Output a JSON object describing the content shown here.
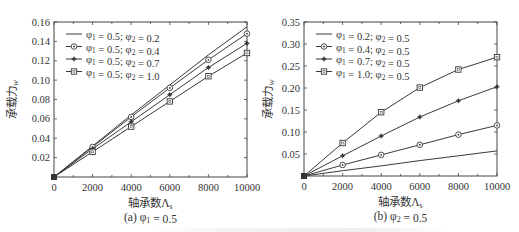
{
  "chart_data": [
    {
      "type": "line",
      "panel_label": "(a) φ1 = 0.5",
      "xlabel": "轴承数Λs",
      "ylabel": "承载力w",
      "xlim": [
        0,
        10000
      ],
      "ylim": [
        0,
        0.16
      ],
      "xticks": [
        0,
        2000,
        4000,
        6000,
        8000,
        10000
      ],
      "yticks": [
        0.02,
        0.04,
        0.06,
        0.08,
        0.1,
        0.12,
        0.14,
        0.16
      ],
      "ytick_labels": [
        "0.02",
        "0.04",
        "0.06",
        "0.08",
        "0.10",
        "0.12",
        "0.14",
        "0.16"
      ],
      "x": [
        0,
        2000,
        4000,
        6000,
        8000,
        10000
      ],
      "legend_position": "upper left",
      "grid": false,
      "series": [
        {
          "name": "φ1 = 0.5; φ2 = 0.2",
          "marker": "none",
          "values": [
            0,
            0.032,
            0.064,
            0.095,
            0.126,
            0.155
          ]
        },
        {
          "name": "φ1 = 0.5; φ2 = 0.4",
          "marker": "circle",
          "values": [
            0,
            0.031,
            0.062,
            0.092,
            0.121,
            0.148
          ]
        },
        {
          "name": "φ1 = 0.5; φ2 = 0.7",
          "marker": "star",
          "values": [
            0,
            0.029,
            0.057,
            0.085,
            0.113,
            0.138
          ]
        },
        {
          "name": "φ1 = 0.5; φ2 = 1.0",
          "marker": "square",
          "values": [
            0,
            0.026,
            0.052,
            0.078,
            0.104,
            0.128
          ]
        }
      ]
    },
    {
      "type": "line",
      "panel_label": "(b) φ2 = 0.5",
      "xlabel": "轴承数Λs",
      "ylabel": "承载力w",
      "xlim": [
        0,
        10000
      ],
      "ylim": [
        0,
        0.35
      ],
      "xticks": [
        0,
        2000,
        4000,
        6000,
        8000,
        10000
      ],
      "yticks": [
        0.05,
        0.1,
        0.15,
        0.2,
        0.25,
        0.3,
        0.35
      ],
      "ytick_labels": [
        "0.05",
        "0.10",
        "0.15",
        "0.20",
        "0.25",
        "0.30",
        "0.35"
      ],
      "x": [
        0,
        2000,
        4000,
        6000,
        8000,
        10000
      ],
      "legend_position": "upper left",
      "grid": false,
      "series": [
        {
          "name": "φ1 = 0.2; φ2 = 0.5",
          "marker": "none",
          "values": [
            0,
            0.012,
            0.023,
            0.035,
            0.046,
            0.057
          ]
        },
        {
          "name": "φ1 = 0.4; φ2 = 0.5",
          "marker": "circle",
          "values": [
            0,
            0.025,
            0.048,
            0.071,
            0.094,
            0.115
          ]
        },
        {
          "name": "φ1 = 0.7; φ2 = 0.5",
          "marker": "star",
          "values": [
            0,
            0.046,
            0.091,
            0.134,
            0.171,
            0.203
          ]
        },
        {
          "name": "φ1 = 1.0; φ2 = 0.5",
          "marker": "square",
          "values": [
            0,
            0.075,
            0.145,
            0.201,
            0.242,
            0.27
          ]
        }
      ]
    }
  ],
  "panels": [
    {
      "xtick_labels": [
        "0",
        "2000",
        "4000",
        "6000",
        "8000",
        "10000"
      ]
    },
    {
      "xtick_labels": [
        "0",
        "2000",
        "4000",
        "6000",
        "8000",
        "10000"
      ]
    }
  ],
  "colors": {
    "line": "#3a3a3a",
    "axis": "#444444",
    "text": "#333333"
  }
}
